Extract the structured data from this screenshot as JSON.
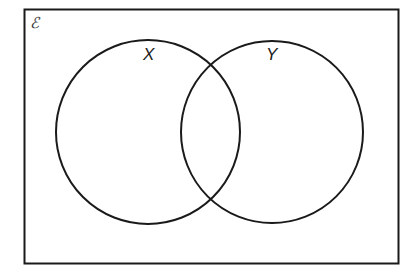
{
  "diagram": {
    "type": "venn",
    "universal_set": {
      "symbol": "ℰ"
    },
    "sets": [
      {
        "label": "X",
        "cx": 148,
        "cy": 132,
        "r": 92
      },
      {
        "label": "Y",
        "cx": 272,
        "cy": 132,
        "r": 91
      }
    ],
    "colors": {
      "stroke": "#1a1a1a",
      "background": "#ffffff"
    }
  }
}
